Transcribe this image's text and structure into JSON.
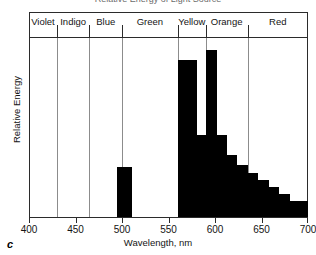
{
  "figure": {
    "panel_letter": "c",
    "title_cropped": "Relative Energy of Light Source",
    "axis_title_x": "Wavelength, nm",
    "axis_title_y": "Relative Energy",
    "colors": {
      "bar": "#000000",
      "axis": "#2b2b2b",
      "gridline": "#8c8c8c",
      "background": "#ffffff"
    }
  },
  "spectrum_band": {
    "bands": [
      {
        "label": "Violet",
        "start_nm": 400,
        "end_nm": 430
      },
      {
        "label": "Indigo",
        "start_nm": 430,
        "end_nm": 465
      },
      {
        "label": "Blue",
        "start_nm": 465,
        "end_nm": 500
      },
      {
        "label": "Green",
        "start_nm": 500,
        "end_nm": 560
      },
      {
        "label": "Yellow",
        "start_nm": 560,
        "end_nm": 590
      },
      {
        "label": "Orange",
        "start_nm": 590,
        "end_nm": 635
      },
      {
        "label": "Red",
        "start_nm": 635,
        "end_nm": 700
      }
    ]
  },
  "x_axis": {
    "min": 400,
    "max": 700,
    "ticks": [
      400,
      450,
      500,
      550,
      600,
      650,
      700
    ],
    "tick_labels": [
      "400",
      "450",
      "500",
      "550",
      "600",
      "650",
      "700"
    ],
    "unit": "nm"
  },
  "y_axis": {
    "label": "Relative Energy",
    "ticks": [],
    "tick_labels": [],
    "min": 0,
    "max": 100
  },
  "chart_data": {
    "type": "bar",
    "title": "Relative Energy of Light Source",
    "xlabel": "Wavelength, nm",
    "ylabel": "Relative Energy",
    "xlim": [
      400,
      700
    ],
    "ylim": [
      0,
      100
    ],
    "grid": true,
    "legend": "none",
    "series": [
      {
        "name": "Relative Energy",
        "color": "#000000",
        "bars": [
          {
            "start_nm": 495,
            "end_nm": 511,
            "value": 28
          },
          {
            "start_nm": 560,
            "end_nm": 581,
            "value": 88
          },
          {
            "start_nm": 581,
            "end_nm": 590,
            "value": 46
          },
          {
            "start_nm": 590,
            "end_nm": 602,
            "value": 94
          },
          {
            "start_nm": 602,
            "end_nm": 613,
            "value": 46
          },
          {
            "start_nm": 613,
            "end_nm": 624,
            "value": 35
          },
          {
            "start_nm": 624,
            "end_nm": 635,
            "value": 29
          },
          {
            "start_nm": 635,
            "end_nm": 646,
            "value": 25
          },
          {
            "start_nm": 646,
            "end_nm": 658,
            "value": 21
          },
          {
            "start_nm": 658,
            "end_nm": 669,
            "value": 17
          },
          {
            "start_nm": 669,
            "end_nm": 681,
            "value": 13
          },
          {
            "start_nm": 681,
            "end_nm": 700,
            "value": 9
          }
        ]
      }
    ],
    "annotations": [
      {
        "text": "c",
        "role": "panel-letter"
      }
    ]
  }
}
